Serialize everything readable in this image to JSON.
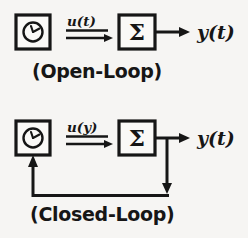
{
  "figure": {
    "background_color": "#f6f5f3",
    "ink_color": "#161616",
    "diagrams": [
      {
        "id": "open-loop",
        "caption": "(Open-Loop)",
        "controller_icon": "clock-icon",
        "plant_symbol": "Σ",
        "input_signal_label": "u(t)",
        "output_signal_label": "y(t)",
        "has_feedback": false
      },
      {
        "id": "closed-loop",
        "caption": "(Closed-Loop)",
        "controller_icon": "clock-icon",
        "plant_symbol": "Σ",
        "input_signal_label": "u(y)",
        "output_signal_label": "y(t)",
        "has_feedback": true
      }
    ]
  }
}
